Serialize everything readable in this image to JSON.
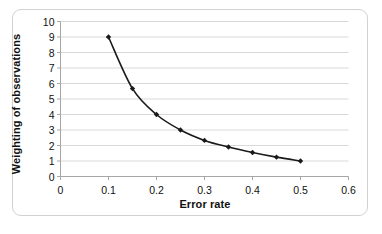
{
  "chart_data": {
    "type": "line",
    "title": "",
    "xlabel": "Error rate",
    "ylabel": "Weighting of observations",
    "x": [
      0.1,
      0.15,
      0.2,
      0.25,
      0.3,
      0.35,
      0.4,
      0.45,
      0.5
    ],
    "values": [
      9.0,
      5.67,
      4.0,
      3.0,
      2.33,
      1.9,
      1.55,
      1.25,
      1.0
    ],
    "series": [
      {
        "name": "Weighting of observations",
        "values": [
          9.0,
          5.67,
          4.0,
          3.0,
          2.33,
          1.9,
          1.55,
          1.25,
          1.0
        ]
      }
    ],
    "xlim": [
      0,
      0.6
    ],
    "ylim": [
      0,
      10
    ],
    "xticks": [
      "0",
      "0.1",
      "0.2",
      "0.3",
      "0.4",
      "0.5",
      "0.6"
    ],
    "xtick_values": [
      0,
      0.1,
      0.2,
      0.3,
      0.4,
      0.5,
      0.6
    ],
    "yticks": [
      "0",
      "1",
      "2",
      "3",
      "4",
      "5",
      "6",
      "7",
      "8",
      "9",
      "10"
    ],
    "ytick_values": [
      0,
      1,
      2,
      3,
      4,
      5,
      6,
      7,
      8,
      9,
      10
    ],
    "grid": "horizontal",
    "legend": "none",
    "marker": "diamond",
    "line_color": "#1a1a1a",
    "marker_color": "#1a1a1a",
    "grid_color": "#d9d9d9",
    "axis_color": "#a6a6a6",
    "frame_color": "#d2d2d2",
    "background": "#ffffff"
  }
}
